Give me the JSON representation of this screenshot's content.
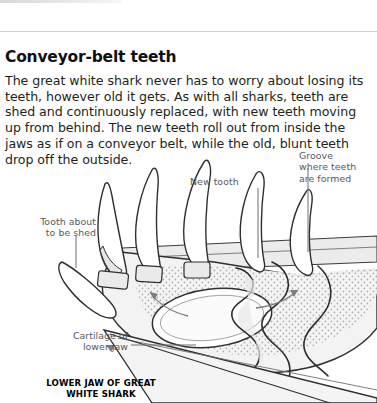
{
  "article": {
    "headline": "Conveyor-belt teeth",
    "body": "The great white shark never has to worry about losing its teeth, however old it gets. As with all sharks, teeth are shed and continuously replaced, with new teeth moving up from behind. The new teeth roll out from inside the jaws as if on a conveyor belt, while the old, blunt teeth drop off the outside."
  },
  "diagram": {
    "caption": "LOWER JAW OF\nGREAT WHITE SHARK",
    "labels": {
      "new_tooth": "New tooth",
      "groove": "Groove\nwhere teeth\nare formed",
      "tooth_shed": "Tooth about\nto be shed",
      "cartilage": "Cartilage of\nlower jaw"
    }
  },
  "colors": {
    "text": "#231f20",
    "label_text": "#58595b",
    "rule": "#d2d2d4",
    "ink": "#231f20",
    "fill_light": "#f2f2f2",
    "fill_mid": "#e2e2e2",
    "arrow": "#6d6e71"
  }
}
